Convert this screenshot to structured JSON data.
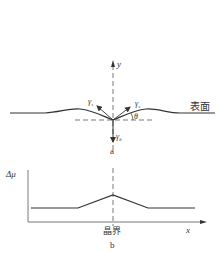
{
  "figure_a": {
    "y_axis_label": "y",
    "gamma_s_left": "γ",
    "gamma_s_left_sub": "s",
    "gamma_s_right": "γ",
    "gamma_s_right_sub": "s",
    "gamma_b": "γ",
    "gamma_b_sub": "b",
    "theta_label": "θ",
    "surface_label": "表面",
    "caption": "a"
  },
  "figure_b": {
    "y_axis_label": "Δμ",
    "x_axis_label": "x",
    "grain_boundary_label": "晶界",
    "caption": "b"
  },
  "colors": {
    "line": "#333333",
    "dashed": "#555555",
    "text": "#333333"
  }
}
